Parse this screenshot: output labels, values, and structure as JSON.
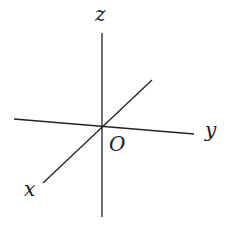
{
  "diagram": {
    "type": "3d-coordinate-axes",
    "labels": {
      "z": "z",
      "y": "y",
      "x": "x",
      "origin": "O"
    },
    "line_color": "#222222"
  }
}
